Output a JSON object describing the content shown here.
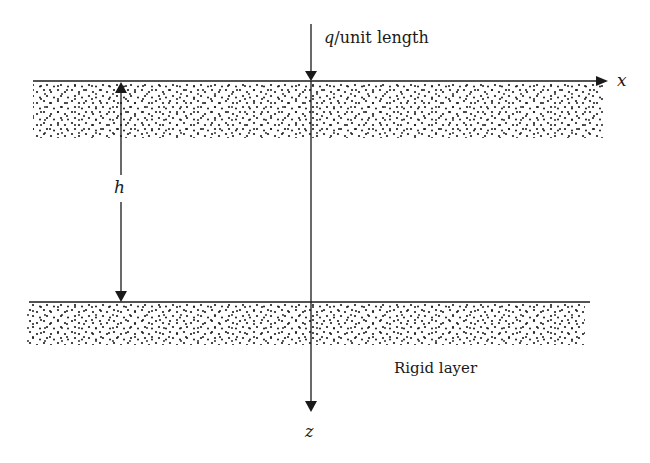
{
  "diagram": {
    "type": "soil-layer-schematic",
    "load_label_var": "q",
    "load_label_rest": "/unit length",
    "x_axis_label": "x",
    "z_axis_label": "z",
    "thickness_label": "h",
    "bottom_layer_label": "Rigid layer",
    "colors": {
      "line": "#1a1a1a",
      "dots": "#1a1a1a",
      "background": "#ffffff"
    }
  }
}
